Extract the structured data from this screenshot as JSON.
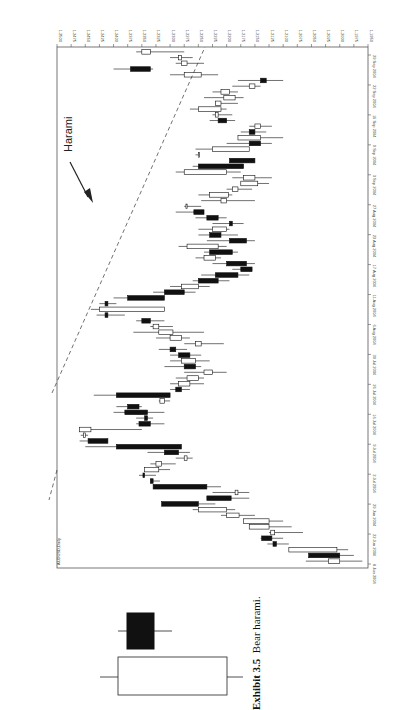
{
  "figure": {
    "exhibit_label": "Exhibit 3.5",
    "caption_text": "Bear harami.",
    "annotation": "Harami"
  },
  "chart_data": {
    "type": "candlestick",
    "title": "AUDUSD,Daily",
    "orientation": "rotated-90-clockwise",
    "xlabel": "",
    "ylabel": "",
    "ylim": [
      1.195,
      1.25
    ],
    "y_ticks": [
      "1.2500",
      "1.2475",
      "1.2450",
      "1.2425",
      "1.2400",
      "1.2375",
      "1.2350",
      "1.2325",
      "1.2300",
      "1.2275",
      "1.2250",
      "1.2225",
      "1.2200",
      "1.2175",
      "1.2150",
      "1.2125",
      "1.2100",
      "1.2075",
      "1.2050",
      "1.2025",
      "1.2000",
      "1.1975",
      "1.1950"
    ],
    "x_ticks": [
      "8 Jun 2004",
      "22 Jun 2004",
      "29 Jun 2004",
      "2 Jul 2004",
      "9 Jul 2004",
      "16 Jul 2004",
      "26 Jul 2004",
      "30 Jul 2004",
      "6 Aug 2004",
      "11 Aug 2004",
      "17 Aug 2004",
      "23 Aug 2004",
      "27 Aug 2004",
      "3 Sep 2004",
      "9 Sep 2004",
      "16 Sep 2004",
      "22 Sep 2004",
      "29 Sep 2004"
    ],
    "trendline": "dashed resistance line from late-July high to late-September",
    "candles": [
      {
        "o": 1.2,
        "h": 1.206,
        "l": 1.196,
        "c": 1.202
      },
      {
        "o": 1.2,
        "h": 1.204,
        "l": 1.1975,
        "c": 1.2055,
        "bear": true
      },
      {
        "o": 1.2005,
        "h": 1.2055,
        "l": 1.1985,
        "c": 1.209
      },
      {
        "o": 1.2118,
        "h": 1.2128,
        "l": 1.209,
        "c": 1.2112,
        "bear": true
      },
      {
        "o": 1.212,
        "h": 1.214,
        "l": 1.21,
        "c": 1.2138,
        "bear": true
      },
      {
        "o": 1.2115,
        "h": 1.2125,
        "l": 1.2065,
        "c": 1.2122
      },
      {
        "o": 1.2125,
        "h": 1.2145,
        "l": 1.2085,
        "c": 1.216
      },
      {
        "o": 1.2125,
        "h": 1.215,
        "l": 1.21,
        "c": 1.217
      },
      {
        "o": 1.2178,
        "h": 1.221,
        "l": 1.215,
        "c": 1.22
      },
      {
        "o": 1.22,
        "h": 1.226,
        "l": 1.2185,
        "c": 1.225
      },
      {
        "o": 1.225,
        "h": 1.228,
        "l": 1.222,
        "c": 1.2315,
        "bear": true
      },
      {
        "o": 1.2192,
        "h": 1.223,
        "l": 1.216,
        "c": 1.2235,
        "bear": true
      },
      {
        "o": 1.218,
        "h": 1.2225,
        "l": 1.216,
        "c": 1.2185
      },
      {
        "o": 1.2235,
        "h": 1.225,
        "l": 1.221,
        "c": 1.233,
        "bear": true
      },
      {
        "o": 1.233,
        "h": 1.233,
        "l": 1.2318,
        "c": 1.2335,
        "bear": true
      },
      {
        "o": 1.2345,
        "h": 1.2355,
        "l": 1.2325,
        "c": 1.2348,
        "bear": true
      },
      {
        "o": 1.232,
        "h": 1.234,
        "l": 1.23,
        "c": 1.2345
      },
      {
        "o": 1.2315,
        "h": 1.2335,
        "l": 1.229,
        "c": 1.2325
      },
      {
        "o": 1.227,
        "h": 1.229,
        "l": 1.226,
        "c": 1.2275
      },
      {
        "o": 1.231,
        "h": 1.234,
        "l": 1.2265,
        "c": 1.2285,
        "bear": true
      },
      {
        "o": 1.2395,
        "h": 1.245,
        "l": 1.23,
        "c": 1.228,
        "bear": true
      },
      {
        "o": 1.2445,
        "h": 1.246,
        "l": 1.241,
        "c": 1.241,
        "bear": true
      },
      {
        "o": 1.245,
        "h": 1.2458,
        "l": 1.2445,
        "c": 1.2453
      },
      {
        "o": 1.244,
        "h": 1.246,
        "l": 1.235,
        "c": 1.246
      },
      {
        "o": 1.2335,
        "h": 1.236,
        "l": 1.231,
        "c": 1.2355,
        "bear": true
      },
      {
        "o": 1.2345,
        "h": 1.236,
        "l": 1.233,
        "c": 1.234,
        "bear": true
      },
      {
        "o": 1.234,
        "h": 1.24,
        "l": 1.231,
        "c": 1.238,
        "bear": true
      },
      {
        "o": 1.2375,
        "h": 1.2395,
        "l": 1.235,
        "c": 1.2355,
        "bear": true
      },
      {
        "o": 1.231,
        "h": 1.232,
        "l": 1.23,
        "c": 1.2318
      },
      {
        "o": 1.2395,
        "h": 1.2435,
        "l": 1.235,
        "c": 1.23,
        "bear": true
      },
      {
        "o": 1.229,
        "h": 1.23,
        "l": 1.2265,
        "c": 1.228,
        "bear": true
      },
      {
        "o": 1.2285,
        "h": 1.23,
        "l": 1.224,
        "c": 1.2265
      },
      {
        "o": 1.227,
        "h": 1.229,
        "l": 1.224,
        "c": 1.225
      },
      {
        "o": 1.2225,
        "h": 1.2275,
        "l": 1.22,
        "c": 1.224
      },
      {
        "o": 1.2275,
        "h": 1.231,
        "l": 1.2245,
        "c": 1.2255,
        "bear": true
      },
      {
        "o": 1.228,
        "h": 1.23,
        "l": 1.223,
        "c": 1.2255
      },
      {
        "o": 1.2285,
        "h": 1.23,
        "l": 1.2245,
        "c": 1.2265,
        "bear": true
      },
      {
        "o": 1.23,
        "h": 1.232,
        "l": 1.227,
        "c": 1.229,
        "bear": true
      },
      {
        "o": 1.2245,
        "h": 1.2275,
        "l": 1.2205,
        "c": 1.2255
      },
      {
        "o": 1.23,
        "h": 1.2325,
        "l": 1.2265,
        "c": 1.228
      },
      {
        "o": 1.232,
        "h": 1.2365,
        "l": 1.224,
        "c": 1.2295
      },
      {
        "o": 1.233,
        "h": 1.2335,
        "l": 1.2295,
        "c": 1.232
      },
      {
        "o": 1.235,
        "h": 1.236,
        "l": 1.231,
        "c": 1.2335,
        "bear": true
      },
      {
        "o": 1.2415,
        "h": 1.243,
        "l": 1.238,
        "c": 1.241,
        "bear": true
      },
      {
        "o": 1.2425,
        "h": 1.244,
        "l": 1.24,
        "c": 1.231
      },
      {
        "o": 1.241,
        "h": 1.2425,
        "l": 1.2395,
        "c": 1.2415,
        "bear": true
      },
      {
        "o": 1.2375,
        "h": 1.24,
        "l": 1.236,
        "c": 1.231,
        "bear": true
      },
      {
        "o": 1.231,
        "h": 1.233,
        "l": 1.2255,
        "c": 1.2275,
        "bear": true
      },
      {
        "o": 1.228,
        "h": 1.23,
        "l": 1.223,
        "c": 1.225
      },
      {
        "o": 1.225,
        "h": 1.226,
        "l": 1.2195,
        "c": 1.2215,
        "bear": true
      },
      {
        "o": 1.222,
        "h": 1.2245,
        "l": 1.216,
        "c": 1.218,
        "bear": true
      },
      {
        "o": 1.2175,
        "h": 1.219,
        "l": 1.2155,
        "c": 1.2155,
        "bear": true
      },
      {
        "o": 1.22,
        "h": 1.2225,
        "l": 1.215,
        "c": 1.2165,
        "bear": true
      },
      {
        "o": 1.224,
        "h": 1.2255,
        "l": 1.221,
        "c": 1.222
      },
      {
        "o": 1.223,
        "h": 1.224,
        "l": 1.218,
        "c": 1.219,
        "bear": true
      },
      {
        "o": 1.2215,
        "h": 1.2285,
        "l": 1.22,
        "c": 1.227
      },
      {
        "o": 1.2195,
        "h": 1.2235,
        "l": 1.215,
        "c": 1.2165,
        "bear": true
      },
      {
        "o": 1.221,
        "h": 1.225,
        "l": 1.218,
        "c": 1.223,
        "bear": true
      },
      {
        "o": 1.2225,
        "h": 1.225,
        "l": 1.2195,
        "c": 1.22
      },
      {
        "o": 1.219,
        "h": 1.2225,
        "l": 1.217,
        "c": 1.2195,
        "bear": true
      },
      {
        "o": 1.2235,
        "h": 1.2255,
        "l": 1.22,
        "c": 1.2215,
        "bear": true
      },
      {
        "o": 1.224,
        "h": 1.229,
        "l": 1.224,
        "c": 1.2258,
        "bear": true
      },
      {
        "o": 1.227,
        "h": 1.2275,
        "l": 1.2245,
        "c": 1.2272
      },
      {
        "o": 1.22,
        "h": 1.2245,
        "l": 1.215,
        "c": 1.221
      },
      {
        "o": 1.223,
        "h": 1.225,
        "l": 1.219,
        "c": 1.2197
      },
      {
        "o": 1.218,
        "h": 1.22,
        "l": 1.2155,
        "c": 1.219
      },
      {
        "o": 1.2145,
        "h": 1.2175,
        "l": 1.2125,
        "c": 1.2175
      },
      {
        "o": 1.217,
        "h": 1.219,
        "l": 1.212,
        "c": 1.215
      },
      {
        "o": 1.2275,
        "h": 1.229,
        "l": 1.2175,
        "c": 1.22
      },
      {
        "o": 1.225,
        "h": 1.226,
        "l": 1.219,
        "c": 1.217,
        "bear": true
      },
      {
        "o": 1.2195,
        "h": 1.219,
        "l": 1.216,
        "c": 1.215,
        "bear": true
      },
      {
        "o": 1.225,
        "h": 1.2255,
        "l": 1.225,
        "c": 1.225
      },
      {
        "o": 1.2225,
        "h": 1.2255,
        "l": 1.2225,
        "c": 1.216
      },
      {
        "o": 1.216,
        "h": 1.22,
        "l": 1.212,
        "c": 1.214,
        "bear": true
      },
      {
        "o": 1.214,
        "h": 1.2165,
        "l": 1.21,
        "c": 1.218
      },
      {
        "o": 1.215,
        "h": 1.2175,
        "l": 1.213,
        "c": 1.216,
        "bear": true
      },
      {
        "o": 1.214,
        "h": 1.216,
        "l": 1.212,
        "c": 1.215
      },
      {
        "o": 1.22,
        "h": 1.223,
        "l": 1.2185,
        "c": 1.2215,
        "bear": true
      },
      {
        "o": 1.222,
        "h": 1.2225,
        "l": 1.219,
        "c": 1.2215
      },
      {
        "o": 1.225,
        "h": 1.2265,
        "l": 1.22,
        "c": 1.221
      },
      {
        "o": 1.221,
        "h": 1.222,
        "l": 1.218,
        "c": 1.222
      },
      {
        "o": 1.2185,
        "h": 1.224,
        "l": 1.217,
        "c": 1.2205
      },
      {
        "o": 1.221,
        "h": 1.2225,
        "l": 1.218,
        "c": 1.2195
      },
      {
        "o": 1.216,
        "h": 1.219,
        "l": 1.214,
        "c": 1.215
      },
      {
        "o": 1.213,
        "h": 1.218,
        "l": 1.21,
        "c": 1.214,
        "bear": true
      },
      {
        "o": 1.2275,
        "h": 1.23,
        "l": 1.2215,
        "c": 1.2245
      },
      {
        "o": 1.237,
        "h": 1.24,
        "l": 1.233,
        "c": 1.2335,
        "bear": true
      },
      {
        "o": 1.228,
        "h": 1.229,
        "l": 1.224,
        "c": 1.227
      },
      {
        "o": 1.228,
        "h": 1.23,
        "l": 1.226,
        "c": 1.2285
      },
      {
        "o": 1.2335,
        "h": 1.236,
        "l": 1.2275,
        "c": 1.235
      }
    ]
  }
}
